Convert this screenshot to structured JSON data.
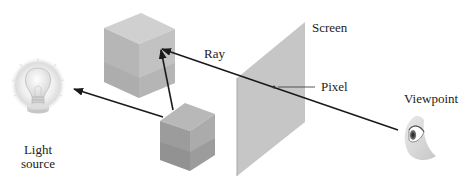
{
  "diagram": {
    "labels": {
      "light_source_line1": "Light",
      "light_source_line2": "source",
      "ray": "Ray",
      "screen": "Screen",
      "pixel": "Pixel",
      "viewpoint": "Viewpoint"
    },
    "nodes": [
      {
        "id": "light-source",
        "type": "light-bulb",
        "label": "Light source"
      },
      {
        "id": "cube-upper",
        "type": "cube"
      },
      {
        "id": "cube-lower",
        "type": "cube"
      },
      {
        "id": "screen",
        "type": "plane",
        "label": "Screen"
      },
      {
        "id": "pixel",
        "type": "point",
        "label": "Pixel"
      },
      {
        "id": "viewpoint",
        "type": "eye",
        "label": "Viewpoint"
      }
    ],
    "edges": [
      {
        "from": "viewpoint",
        "to": "cube-upper",
        "via": "pixel",
        "label": "Ray",
        "arrow": "end"
      },
      {
        "from": "cube-lower",
        "to": "cube-upper",
        "arrow": "end"
      },
      {
        "from": "cube-lower",
        "to": "light-source",
        "arrow": "end"
      }
    ],
    "colors": {
      "background": "#ffffff",
      "screen": "#c4c4c4",
      "cube_top": "#cfcfcf",
      "cube_left": "#b4b4b4",
      "cube_right": "#a4a4a4",
      "line": "#1a1a1a",
      "text": "#222222"
    }
  }
}
